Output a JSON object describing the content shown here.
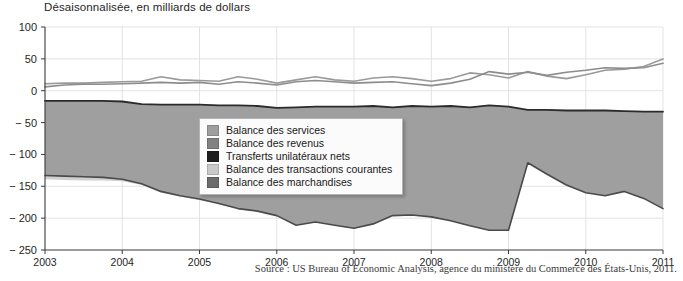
{
  "chart_data": {
    "type": "area",
    "title": "Désaisonnalisée, en milliards de dollars",
    "xlabel": "",
    "ylabel": "",
    "ylim": [
      -250,
      100
    ],
    "xlim": [
      2003,
      2011
    ],
    "grid": true,
    "legend_position": "center",
    "y_ticks": [
      "100",
      "50",
      "0",
      "− 50",
      "− 100",
      "− 150",
      "− 200",
      "− 250"
    ],
    "y_tick_values": [
      100,
      50,
      0,
      -50,
      -100,
      -150,
      -200,
      -250
    ],
    "x_ticks": [
      "2003",
      "2004",
      "2005",
      "2006",
      "2007",
      "2008",
      "2009",
      "2010",
      "2011"
    ],
    "x_tick_values": [
      2003,
      2004,
      2005,
      2006,
      2007,
      2008,
      2009,
      2010,
      2011
    ],
    "source": "Source : US Bureau of Economic Analysis, agence du ministère du Commerce des États-Unis, 2011.",
    "x": [
      2003.0,
      2003.25,
      2003.5,
      2003.75,
      2004.0,
      2004.25,
      2004.5,
      2004.75,
      2005.0,
      2005.25,
      2005.5,
      2005.75,
      2006.0,
      2006.25,
      2006.5,
      2006.75,
      2007.0,
      2007.25,
      2007.5,
      2007.75,
      2008.0,
      2008.25,
      2008.5,
      2008.75,
      2009.0,
      2009.25,
      2009.5,
      2009.75,
      2010.0,
      2010.25,
      2010.5,
      2010.75,
      2011.0
    ],
    "series": [
      {
        "name": "Balance des services",
        "color": "#9a9a9a",
        "values": [
          11,
          12,
          12,
          13,
          14,
          15,
          22,
          17,
          16,
          15,
          22,
          18,
          12,
          17,
          22,
          17,
          15,
          20,
          22,
          19,
          15,
          19,
          28,
          25,
          20,
          30,
          23,
          19,
          25,
          32,
          34,
          38,
          50
        ]
      },
      {
        "name": "Balance des revenus",
        "color": "#8d8d8d",
        "values": [
          6,
          9,
          10,
          10,
          11,
          12,
          13,
          12,
          13,
          10,
          14,
          12,
          9,
          14,
          16,
          14,
          12,
          13,
          14,
          11,
          8,
          12,
          18,
          30,
          26,
          29,
          24,
          29,
          32,
          36,
          35,
          36,
          43
        ]
      },
      {
        "name": "Transferts unilatéraux nets",
        "color": "#2b2b2b",
        "values": [
          -16,
          -16,
          -16,
          -16,
          -17,
          -21,
          -22,
          -22,
          -22,
          -23,
          -23,
          -24,
          -27,
          -26,
          -25,
          -25,
          -25,
          -24,
          -26,
          -24,
          -25,
          -24,
          -26,
          -23,
          -25,
          -30,
          -30,
          -31,
          -31,
          -31,
          -32,
          -33,
          -33
        ]
      },
      {
        "name": "Balance des transactions courantes",
        "color": "#d3d3d3",
        "values": [
          -139,
          -140,
          -141,
          -141,
          -142,
          -148,
          -160,
          -166,
          -172,
          -178,
          -186,
          -190,
          -193,
          -199,
          -205,
          -209,
          -200,
          -191,
          -182,
          -180,
          -178,
          -178,
          -182,
          -155,
          -113,
          -105,
          -98,
          -96,
          -110,
          -116,
          -122,
          -124,
          -119
        ]
      },
      {
        "name": "Balance des marchandises",
        "color": "#4a4a4a",
        "values": [
          -133,
          -134,
          -135,
          -136,
          -139,
          -146,
          -158,
          -165,
          -170,
          -177,
          -185,
          -189,
          -196,
          -211,
          -206,
          -211,
          -216,
          -209,
          -196,
          -195,
          -198,
          -204,
          -212,
          -219,
          -219,
          -113,
          -131,
          -148,
          -160,
          -165,
          -158,
          -169,
          -185
        ]
      }
    ]
  },
  "legend": {
    "items": [
      {
        "label": "Balance des services",
        "color": "#9e9e9e"
      },
      {
        "label": "Balance des revenus",
        "color": "#828282"
      },
      {
        "label": "Transferts unilatéraux nets",
        "color": "#1e1e1e"
      },
      {
        "label": "Balance des transactions courantes",
        "color": "#c9c9c9"
      },
      {
        "label": "Balance des marchandises",
        "color": "#6b6b6b"
      }
    ]
  }
}
